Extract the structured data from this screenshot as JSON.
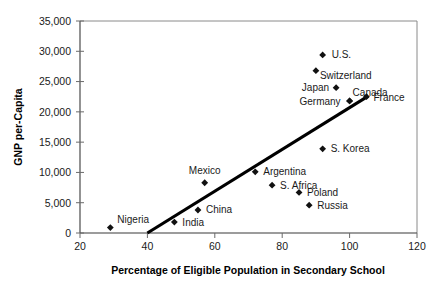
{
  "chart_data": {
    "type": "scatter",
    "title": "",
    "xlabel": "Percentage of Eligible Population in Secondary School",
    "ylabel": "GNP per-Capita",
    "xlim": [
      20,
      120
    ],
    "ylim": [
      0,
      35000
    ],
    "xticks": [
      "20",
      "40",
      "60",
      "80",
      "100",
      "120"
    ],
    "xtick_values": [
      20,
      40,
      60,
      80,
      100,
      120
    ],
    "yticks": [
      "0",
      "5,000",
      "10,000",
      "15,000",
      "20,000",
      "25,000",
      "30,000",
      "35,000"
    ],
    "ytick_values": [
      0,
      5000,
      10000,
      15000,
      20000,
      25000,
      30000,
      35000
    ],
    "grid": false,
    "legend": "none",
    "points": [
      {
        "label": "U.S.",
        "x": 92,
        "y": 29400,
        "label_dx": 9,
        "label_dy": 3.5,
        "anchor": "start"
      },
      {
        "label": "Switzerland",
        "x": 90,
        "y": 26800,
        "label_dx": 4,
        "label_dy": 8.5,
        "anchor": "start"
      },
      {
        "label": "Japan",
        "x": 96,
        "y": 24000,
        "label_dx": -7,
        "label_dy": 3.5,
        "anchor": "end"
      },
      {
        "label": "Canada",
        "x": 100,
        "y": 21800,
        "label_dx": 3,
        "label_dy": -4.5,
        "anchor": "start"
      },
      {
        "label": "Germany",
        "x": 100,
        "y": 21800,
        "label_dx": -9,
        "label_dy": 4.0,
        "anchor": "end"
      },
      {
        "label": "France",
        "x": 105,
        "y": 22500,
        "label_dx": 7,
        "label_dy": 4.5,
        "anchor": "start"
      },
      {
        "label": "S. Korea",
        "x": 92,
        "y": 13900,
        "label_dx": 8,
        "label_dy": 3.5,
        "anchor": "start"
      },
      {
        "label": "Argentina",
        "x": 72,
        "y": 10100,
        "label_dx": 8,
        "label_dy": 3.5,
        "anchor": "start"
      },
      {
        "label": "S. Africa",
        "x": 77,
        "y": 7900,
        "label_dx": 8,
        "label_dy": 3.5,
        "anchor": "start"
      },
      {
        "label": "Poland",
        "x": 85,
        "y": 6700,
        "label_dx": 8,
        "label_dy": 3.5,
        "anchor": "start"
      },
      {
        "label": "Russia",
        "x": 88,
        "y": 4600,
        "label_dx": 8,
        "label_dy": 3.5,
        "anchor": "start"
      },
      {
        "label": "Mexico",
        "x": 57,
        "y": 8300,
        "label_dx": 0,
        "label_dy": -9,
        "anchor": "middle"
      },
      {
        "label": "China",
        "x": 55,
        "y": 3800,
        "label_dx": 8,
        "label_dy": 3.5,
        "anchor": "start"
      },
      {
        "label": "India",
        "x": 48,
        "y": 1800,
        "label_dx": 8,
        "label_dy": 4.0,
        "anchor": "start"
      },
      {
        "label": "Nigeria",
        "x": 29,
        "y": 900,
        "label_dx": 7,
        "label_dy": -5,
        "anchor": "start"
      }
    ],
    "trendline": {
      "name": "linear fit",
      "x0": 40,
      "y0": 0,
      "x1": 105.5,
      "y1": 22600
    }
  }
}
